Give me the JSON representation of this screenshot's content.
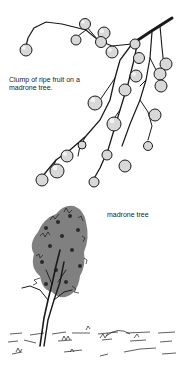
{
  "figure": {
    "fruit_illustration": {
      "subject": "branch with clump of ripe madrone fruit",
      "caption_line1": "Clump of ripe fruit on a",
      "caption_line2": "madrone tree."
    },
    "tree_illustration": {
      "subject": "madrone tree standing in grassy field",
      "caption": "madrone tree"
    },
    "colors": {
      "ink": "#1a1a1a",
      "background": "#ffffff",
      "fruit_fill": "#d8d8d8"
    }
  }
}
